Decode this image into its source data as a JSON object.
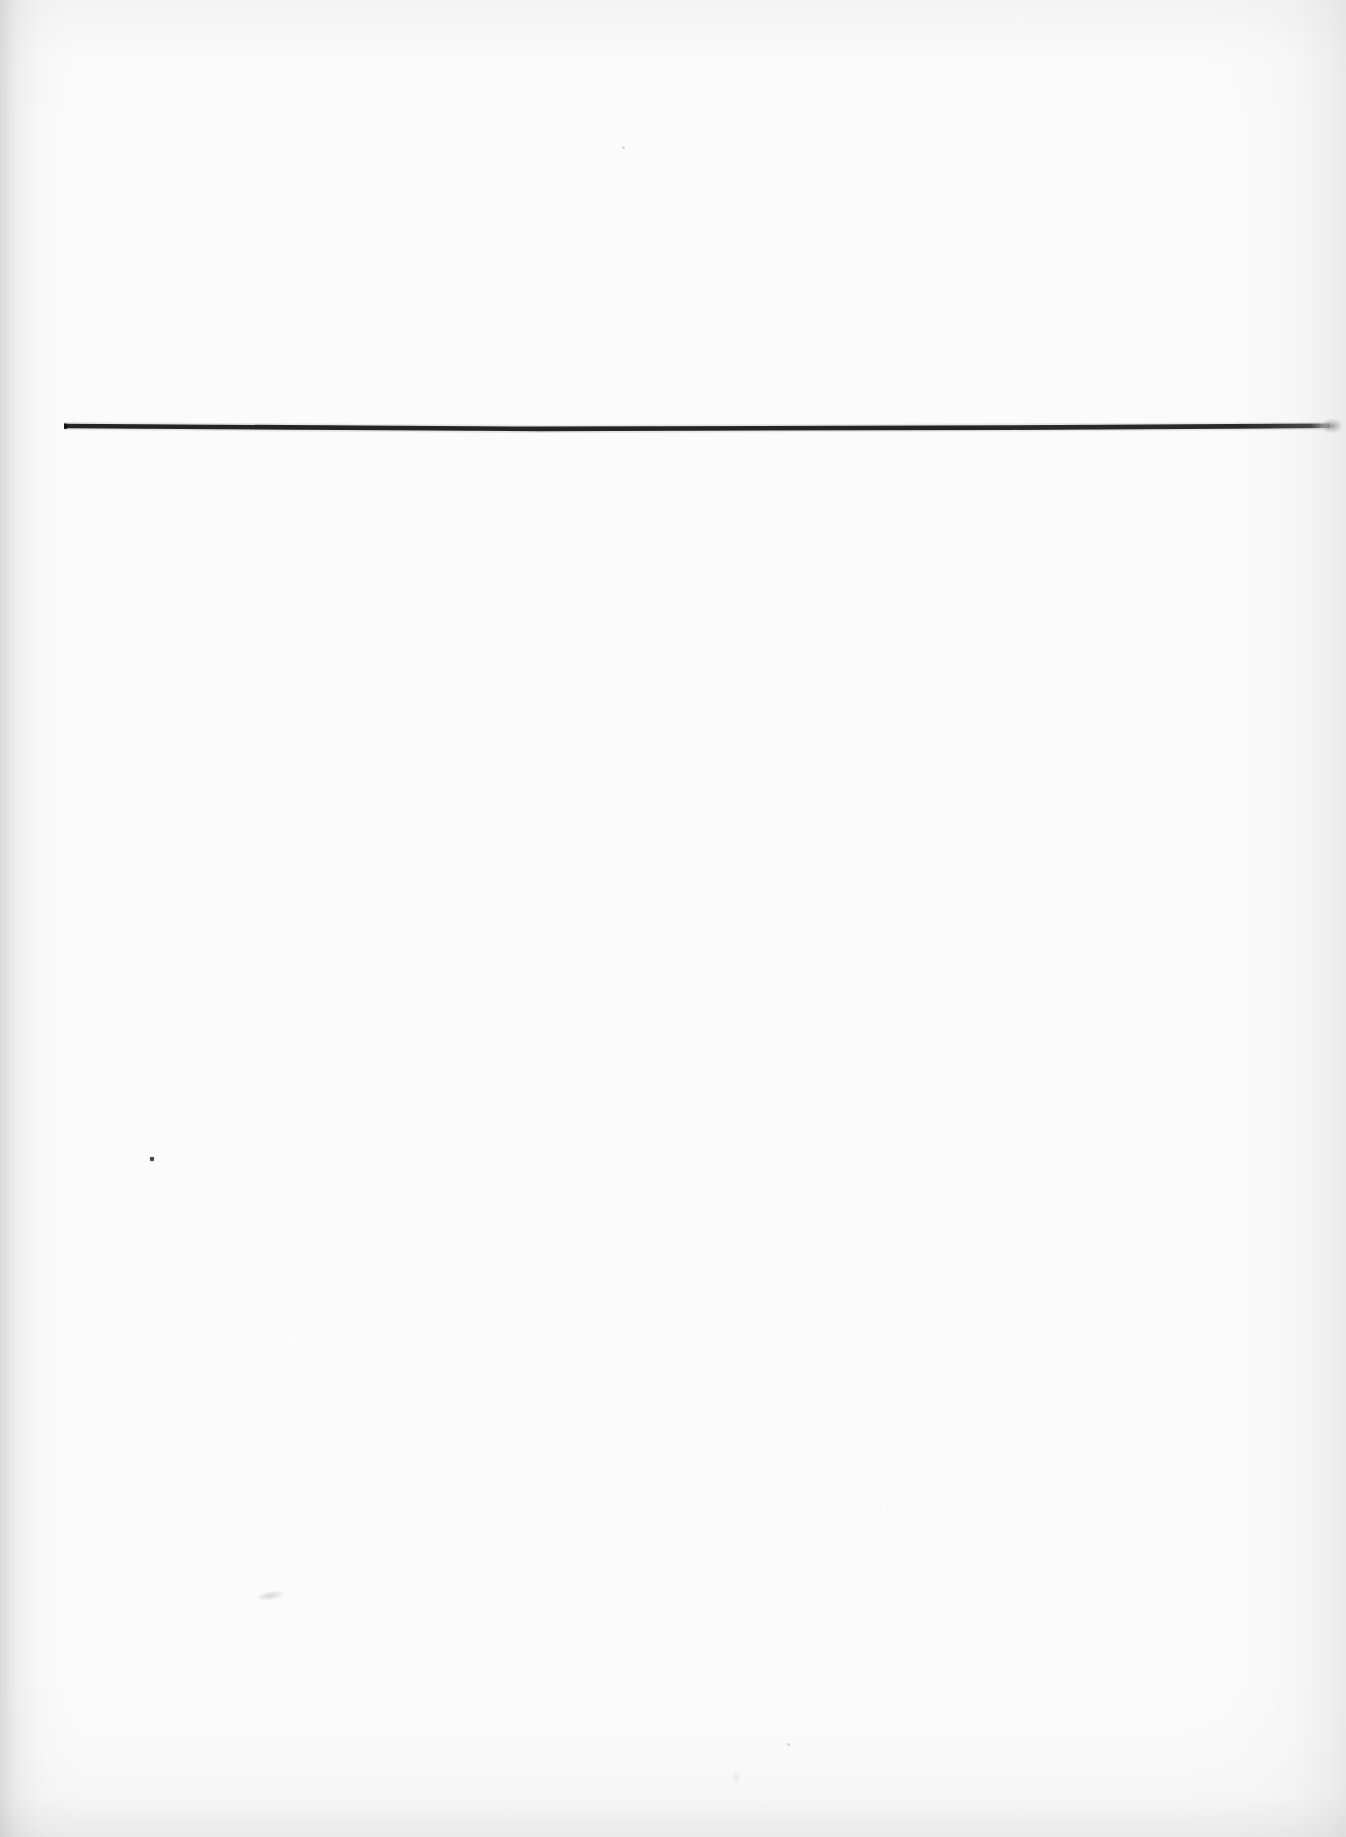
{
  "page": {
    "kind": "scanned-document-page",
    "width": 1346,
    "height": 1837,
    "background_color": "#fdfdfd",
    "content_description": "Blank scanned page containing a single horizontal black rule near the top and a few incidental scanning specks.",
    "text_content": ""
  },
  "marks": {
    "horizontal_rule": {
      "label": "horizontal-rule",
      "color": "#1a1a1a",
      "x_start": 64,
      "x_end": 1330,
      "y": 428,
      "thickness": 4.5,
      "end_style": "soft-fade"
    },
    "speck": {
      "label": "ink-speck",
      "color": "#4a4a4a",
      "x": 150,
      "y": 1157,
      "size": 4
    },
    "smudge": {
      "label": "faint-smudge",
      "color": "#c4c4c4",
      "x": 258,
      "y": 1591,
      "width": 26,
      "height": 9
    },
    "smudge_secondary": {
      "label": "faint-smudge-secondary",
      "color": "#d7d7d7",
      "x": 731,
      "y": 1770,
      "width": 10,
      "height": 16
    },
    "speck_upper": {
      "label": "faint-speck-upper",
      "color": "#bcbcbc",
      "x": 622,
      "y": 146
    },
    "speck_lower": {
      "label": "faint-speck-lower",
      "color": "#bcbcbc",
      "x": 787,
      "y": 1743
    }
  },
  "edges": {
    "left_shadow_label": "left-edge-shadow",
    "right_shadow_label": "right-edge-shadow",
    "top_shadow_label": "top-edge-shadow",
    "bottom_shadow_label": "bottom-edge-shadow"
  }
}
